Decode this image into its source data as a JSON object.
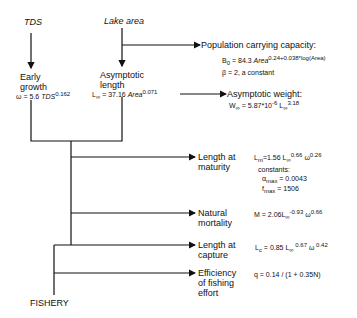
{
  "inputs": {
    "tds": "TDS",
    "lake_area": "Lake area"
  },
  "nodes": {
    "early_growth": {
      "line1": "Early",
      "line2": "growth"
    },
    "asymptotic_length": {
      "line1": "Asymptotic",
      "line2": "length"
    },
    "population_capacity": {
      "label": "Population carrying capacity:"
    },
    "asymptotic_weight": {
      "label": "Asymptotic  weight:"
    },
    "length_maturity": {
      "line1": "Length at",
      "line2": "maturity"
    },
    "natural_mortality": {
      "line1": "Natural",
      "line2": "mortality"
    },
    "length_capture": {
      "line1": "Length at",
      "line2": "capture"
    },
    "efficiency": {
      "line1": "Efficiency",
      "line2": "of fishing",
      "line3": "effort"
    },
    "fishery": "FISHERY"
  },
  "formulas": {
    "omega": {
      "lhs": "ω = 5.6 ",
      "var": "TDS",
      "exp": "0.162"
    },
    "l_inf": {
      "lhs": "L",
      "sub": "∞",
      "mid": " = 37.16 ",
      "var": "Area",
      "exp": "0.071"
    },
    "b0": {
      "lhs": "B",
      "sub": "0",
      "mid": " = 84.3 ",
      "var": "Area",
      "exp": "0.24+0.038*log(Area)"
    },
    "beta": "β = 2,  a constant",
    "w_inf": {
      "lhs": "W",
      "sub": "∞",
      "mid": " = 5.87*10",
      "exp1": "-6",
      "mid2": " L",
      "sub2": "∞",
      "exp2": "3.18"
    },
    "l_m": {
      "lhs": "L",
      "sub": "m",
      "mid": "=1.56 L",
      "sub2": "∞",
      "exp": "0.66",
      "mid2": " ω",
      "exp2": "0.26"
    },
    "constants_label": "constants:",
    "alpha_max": {
      "lhs": "α",
      "sub": "max",
      "val": " =  0.0043"
    },
    "f_max": {
      "lhs": "f",
      "sub": "max",
      "val": " =  1506"
    },
    "m": {
      "lhs": "M = 2.06L",
      "sub": "∞",
      "exp": "-0.93",
      "mid": " ω",
      "exp2": "0.66"
    },
    "l_c": {
      "lhs": "L",
      "sub": "c",
      "mid": " = 0.85 L",
      "sub2": "∞",
      "exp": " 0.67",
      "mid2": " ω",
      "exp2": " 0.42"
    },
    "q": "q = 0.14 / (1 + 0.35N)"
  }
}
